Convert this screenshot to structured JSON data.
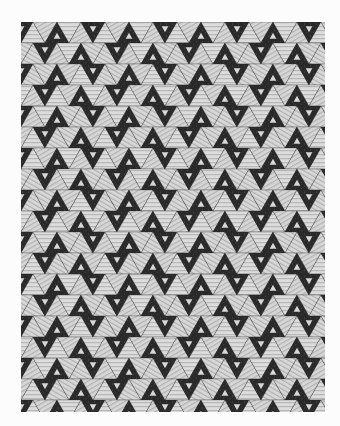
{
  "image": {
    "subject": "Patchwork quilt with repeating triangle pattern",
    "background_color": "#fcfcfc",
    "colors": {
      "dark": "#2b2b2b",
      "dark_speckle": "#4a4a4a",
      "light": "#d9d9d9",
      "light_stripe": "#bdbdbd",
      "mid": "#9a9a9a"
    },
    "quilt_bounds": {
      "x": 21,
      "y": 22,
      "width": 304,
      "height": 390
    },
    "pattern": {
      "type": "triangles-hexagons",
      "row_height": 21,
      "tri_width": 24
    }
  }
}
